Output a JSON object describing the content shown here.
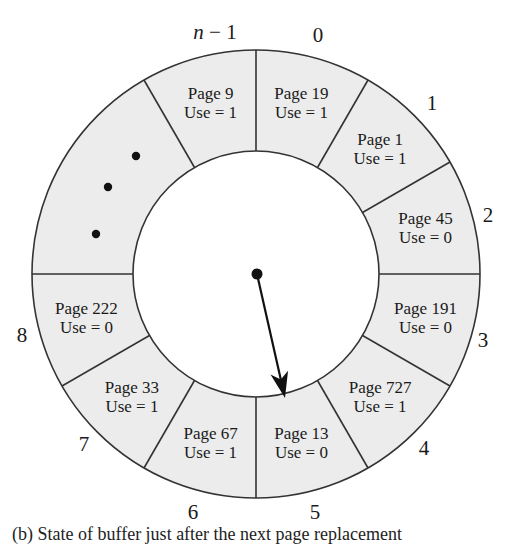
{
  "figure": {
    "caption": "(b) State of buffer just after the next page replacement",
    "colors": {
      "ring_fill": "#ececec",
      "stroke": "#333333",
      "text": "#1a1a1a",
      "background": "#ffffff"
    },
    "geometry": {
      "cx": 256,
      "cy": 274,
      "outer_r": 224,
      "inner_r": 123,
      "slot_angle_deg": 30
    },
    "slots": [
      {
        "index_label": "0",
        "page": "Page 19",
        "use": "Use = 1",
        "start_deg": 0,
        "end_deg": 30
      },
      {
        "index_label": "1",
        "page": "Page 1",
        "use": "Use = 1",
        "start_deg": 30,
        "end_deg": 60
      },
      {
        "index_label": "2",
        "page": "Page 45",
        "use": "Use = 0",
        "start_deg": 60,
        "end_deg": 90
      },
      {
        "index_label": "3",
        "page": "Page 191",
        "use": "Use = 0",
        "start_deg": 90,
        "end_deg": 120
      },
      {
        "index_label": "4",
        "page": "Page 727",
        "use": "Use = 1",
        "start_deg": 120,
        "end_deg": 150
      },
      {
        "index_label": "5",
        "page": "Page 13",
        "use": "Use = 0",
        "start_deg": 150,
        "end_deg": 180
      },
      {
        "index_label": "6",
        "page": "Page 67",
        "use": "Use = 1",
        "start_deg": 180,
        "end_deg": 210
      },
      {
        "index_label": "7",
        "page": "Page 33",
        "use": "Use = 1",
        "start_deg": 210,
        "end_deg": 240
      },
      {
        "index_label": "8",
        "page": "Page 222",
        "use": "Use = 0",
        "start_deg": 240,
        "end_deg": 270
      },
      {
        "index_label": "",
        "page": "",
        "use": "",
        "start_deg": 270,
        "end_deg": 330,
        "ellipsis": true
      },
      {
        "index_label": "n − 1",
        "page": "Page 9",
        "use": "Use = 1",
        "start_deg": 330,
        "end_deg": 360
      }
    ],
    "index_label_positions": {
      "n − 1": [
        215,
        39
      ],
      "0": [
        318,
        42
      ],
      "1": [
        432,
        110
      ],
      "2": [
        488,
        222
      ],
      "3": [
        483,
        347
      ],
      "4": [
        424,
        455
      ],
      "5": [
        315,
        519
      ],
      "6": [
        193,
        519
      ],
      "7": [
        84,
        451
      ],
      "8": [
        22,
        342
      ]
    },
    "ellipsis_dots": [
      [
        136,
        156
      ],
      [
        108,
        187
      ],
      [
        96,
        234
      ]
    ],
    "pointer": {
      "label": "next frame pointer",
      "from": [
        257,
        274
      ],
      "to": [
        285,
        398
      ],
      "points_to_slot": "5"
    }
  }
}
